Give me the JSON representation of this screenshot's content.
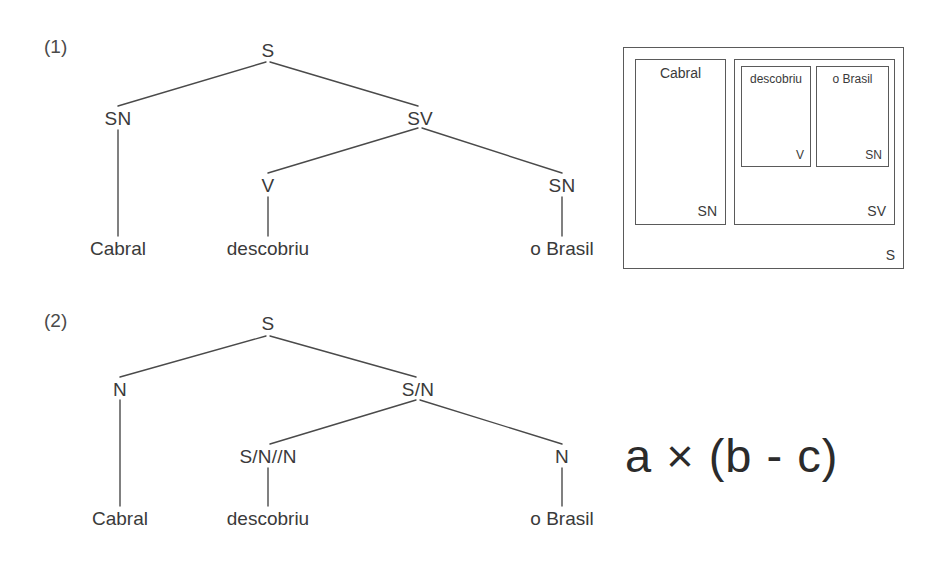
{
  "page": {
    "background_color": "#ffffff",
    "ink_color": "#3a3a3a"
  },
  "examples": [
    {
      "id": "example-1",
      "number": "(1)"
    },
    {
      "id": "example-2",
      "number": "(2)"
    }
  ],
  "tree1": {
    "name": "phrase-structure-tree",
    "nodes": {
      "root": "S",
      "subject": "SN",
      "predicate": "SV",
      "verb": "V",
      "object": "SN"
    },
    "leaves": {
      "subject_word": "Cabral",
      "verb_word": "descobriu",
      "object_word": "o Brasil"
    }
  },
  "tree2": {
    "name": "categorial-grammar-tree",
    "nodes": {
      "root": "S",
      "subject": "N",
      "predicate": "S/N",
      "verb": "S/N//N",
      "object": "N"
    },
    "leaves": {
      "subject_word": "Cabral",
      "verb_word": "descobriu",
      "object_word": "o Brasil"
    }
  },
  "box_diagram": {
    "name": "chinese-box-diagram",
    "outer": {
      "category": "S"
    },
    "subject_box": {
      "word": "Cabral",
      "category": "SN"
    },
    "predicate_box": {
      "category": "SV"
    },
    "verb_box": {
      "word": "descobriu",
      "category": "V"
    },
    "object_box": {
      "word": "o Brasil",
      "category": "SN"
    }
  },
  "formula": {
    "text": "a × (b - c)"
  }
}
